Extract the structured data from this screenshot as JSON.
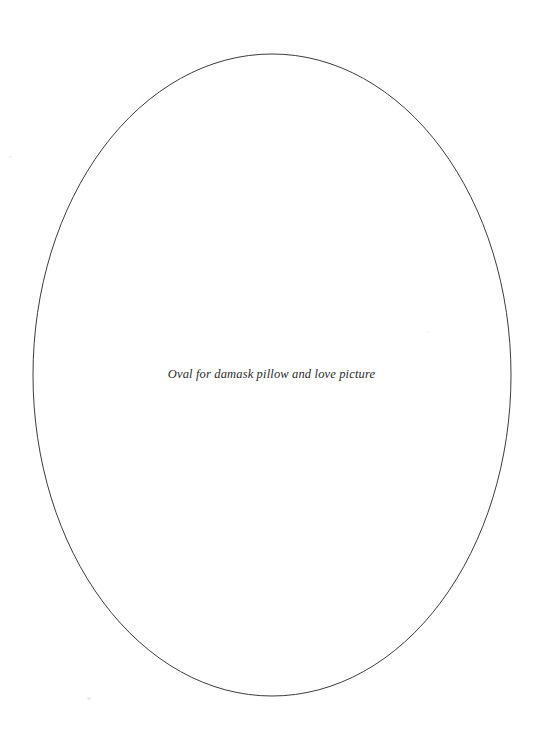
{
  "document": {
    "type": "printable-template",
    "page": {
      "width": 543,
      "height": 733,
      "background_color": "#ffffff"
    }
  },
  "shape": {
    "name": "oval-outline",
    "kind": "ellipse",
    "center_x": 272,
    "center_y": 375,
    "radius_x": 239,
    "radius_y": 321,
    "stroke_color": "#3c3c3c",
    "stroke_width": 1,
    "fill": "none"
  },
  "caption": {
    "text": "Oval for damask pillow and love picture",
    "color": "#2b2b2b",
    "font_size_px": 12.5,
    "style": "italic-serif",
    "center_x": 279,
    "baseline_y": 379
  },
  "artifacts": [
    {
      "name": "speck-lower-left",
      "x": 87,
      "y": 697
    },
    {
      "name": "speck-upper-left",
      "x": 9,
      "y": 156
    },
    {
      "name": "speck-mid-right",
      "x": 426,
      "y": 331
    }
  ]
}
